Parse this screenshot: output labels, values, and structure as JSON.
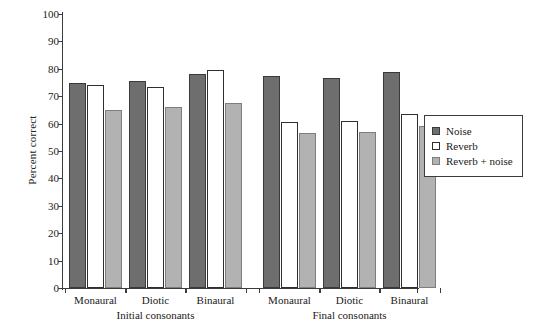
{
  "chart_data": {
    "type": "bar",
    "title": "",
    "xlabel": "",
    "ylabel": "Percent correct",
    "ylim": [
      0,
      100
    ],
    "ytick_step": 10,
    "yticks": [
      0,
      10,
      20,
      30,
      40,
      50,
      60,
      70,
      80,
      90,
      100
    ],
    "grid": false,
    "legend_position": "right",
    "group_labels": [
      "Initial consonants",
      "Final consonants"
    ],
    "categories": [
      "Monaural",
      "Diotic",
      "Binaural",
      "Monaural",
      "Diotic",
      "Binaural"
    ],
    "series": [
      {
        "name": "Noise",
        "color": "#6e6e6e",
        "values": [
          75.0,
          75.5,
          78.0,
          77.5,
          76.5,
          79.0
        ]
      },
      {
        "name": "Reverb",
        "color": "#ffffff",
        "values": [
          74.0,
          73.5,
          79.5,
          60.5,
          61.0,
          63.5
        ]
      },
      {
        "name": "Reverb + noise",
        "color": "#b2b2b2",
        "values": [
          65.0,
          66.0,
          67.5,
          56.5,
          57.0,
          59.0
        ]
      }
    ],
    "groups": [
      {
        "label": "Initial consonants",
        "conditions": [
          {
            "category": "Monaural",
            "Noise": 75.0,
            "Reverb": 74.0,
            "Reverb + noise": 65.0
          },
          {
            "category": "Diotic",
            "Noise": 75.5,
            "Reverb": 73.5,
            "Reverb + noise": 66.0
          },
          {
            "category": "Binaural",
            "Noise": 78.0,
            "Reverb": 79.5,
            "Reverb + noise": 67.5
          }
        ]
      },
      {
        "label": "Final consonants",
        "conditions": [
          {
            "category": "Monaural",
            "Noise": 77.5,
            "Reverb": 60.5,
            "Reverb + noise": 56.5
          },
          {
            "category": "Diotic",
            "Noise": 76.5,
            "Reverb": 61.0,
            "Reverb + noise": 57.0
          },
          {
            "category": "Binaural",
            "Noise": 79.0,
            "Reverb": 63.5,
            "Reverb + noise": 59.0
          }
        ]
      }
    ]
  },
  "axis": {
    "y_label": "Percent correct",
    "y_tick_labels": [
      "100",
      "90",
      "80",
      "70",
      "60",
      "50",
      "40",
      "30",
      "20",
      "10",
      "0"
    ]
  },
  "legend": {
    "entries": [
      {
        "label": "Noise",
        "swatch": "noise"
      },
      {
        "label": "Reverb",
        "swatch": "reverb"
      },
      {
        "label": "Reverb + noise",
        "swatch": "reverbnoise"
      }
    ]
  },
  "x_axis": {
    "category_labels": [
      "Monaural",
      "Diotic",
      "Binaural",
      "Monaural",
      "Diotic",
      "Binaural"
    ],
    "group_labels": [
      "Initial consonants",
      "Final consonants"
    ]
  }
}
